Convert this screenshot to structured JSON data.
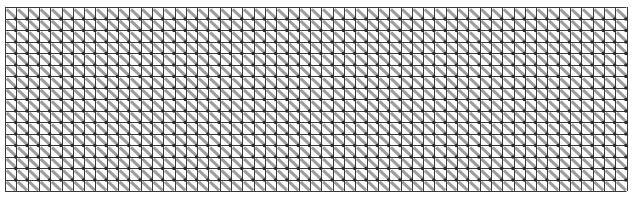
{
  "figure": {
    "type": "grid-pattern",
    "columns": 55,
    "rows": 16,
    "origin": {
      "x": 5,
      "y": 7
    },
    "cell_width": 11.3,
    "cell_height": 11.5,
    "colors": {
      "background": "#ffffff",
      "grid_line": "#3a3a3a",
      "diagonal": "#8c8c8c",
      "node": "#2a2a2a"
    }
  }
}
